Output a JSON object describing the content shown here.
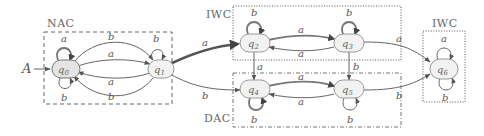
{
  "diagram": {
    "type": "automaton",
    "initial_marker": "A",
    "regions": [
      {
        "id": "nac",
        "label": "NAC",
        "style": "dashed",
        "states": [
          "q0",
          "q1"
        ]
      },
      {
        "id": "iwc1",
        "label": "IWC",
        "style": "dotted",
        "states": [
          "q2",
          "q3"
        ]
      },
      {
        "id": "dac",
        "label": "DAC",
        "style": "dash-dot",
        "states": [
          "q4",
          "q5"
        ]
      },
      {
        "id": "iwc2",
        "label": "IWC",
        "style": "dotted",
        "states": [
          "q6"
        ]
      }
    ],
    "states": [
      {
        "id": "q0",
        "label": "q0",
        "sub": "0",
        "initial": true
      },
      {
        "id": "q1",
        "label": "q1",
        "sub": "1"
      },
      {
        "id": "q2",
        "label": "q2",
        "sub": "2"
      },
      {
        "id": "q3",
        "label": "q3",
        "sub": "3"
      },
      {
        "id": "q4",
        "label": "q4",
        "sub": "4"
      },
      {
        "id": "q5",
        "label": "q5",
        "sub": "5"
      },
      {
        "id": "q6",
        "label": "q6",
        "sub": "6"
      }
    ],
    "transitions": [
      {
        "from": "q0",
        "to": "q0",
        "label": "a"
      },
      {
        "from": "q0",
        "to": "q0",
        "label": "b"
      },
      {
        "from": "q0",
        "to": "q1",
        "label": "b"
      },
      {
        "from": "q0",
        "to": "q1",
        "label": "a"
      },
      {
        "from": "q1",
        "to": "q0",
        "label": "a"
      },
      {
        "from": "q1",
        "to": "q0",
        "label": "b"
      },
      {
        "from": "q1",
        "to": "q1",
        "label": "b"
      },
      {
        "from": "q1",
        "to": "q2",
        "label": "a"
      },
      {
        "from": "q1",
        "to": "q4",
        "label": "b"
      },
      {
        "from": "q2",
        "to": "q2",
        "label": "b"
      },
      {
        "from": "q2",
        "to": "q3",
        "label": "a"
      },
      {
        "from": "q3",
        "to": "q2",
        "label": "a"
      },
      {
        "from": "q3",
        "to": "q3",
        "label": "b"
      },
      {
        "from": "q2",
        "to": "q4",
        "label": "a"
      },
      {
        "from": "q3",
        "to": "q5",
        "label": "b"
      },
      {
        "from": "q3",
        "to": "q6",
        "label": "a"
      },
      {
        "from": "q4",
        "to": "q4",
        "label": "b"
      },
      {
        "from": "q4",
        "to": "q5",
        "label": "a"
      },
      {
        "from": "q5",
        "to": "q4",
        "label": "a"
      },
      {
        "from": "q5",
        "to": "q5",
        "label": "b"
      },
      {
        "from": "q5",
        "to": "q6",
        "label": "b"
      },
      {
        "from": "q6",
        "to": "q6",
        "label": "a"
      },
      {
        "from": "q6",
        "to": "q6",
        "label": "b"
      }
    ]
  },
  "labels": {
    "initial": "A",
    "nac": "NAC",
    "iwc_top": "IWC",
    "dac": "DAC",
    "iwc_right": "IWC",
    "q": "q",
    "s0": "0",
    "s1": "1",
    "s2": "2",
    "s3": "3",
    "s4": "4",
    "s5": "5",
    "s6": "6",
    "a": "a",
    "b": "b"
  }
}
